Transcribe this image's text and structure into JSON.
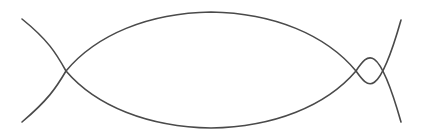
{
  "figure": {
    "title": "Two crossing arcs forming a vesica lens",
    "background_color": "#ffffff",
    "stroke_color": "#4a4a4a",
    "stroke_width": 1.6,
    "width": 423,
    "height": 139,
    "shape_name": "vesica-piscis-with-tails",
    "curves": [
      {
        "name": "upper-arc",
        "description": "Arc from lower-left tail, rising across the figure, peaking near the top center, descending to the upper-right tail",
        "start_point": [
          22,
          122
        ],
        "end_point": [
          401,
          20
        ],
        "apex_point": [
          211,
          12
        ],
        "path": "M 22 122 C 48 100 56 88 66 71 C 96 35 148 13 211 12 C 274 13 326 35 356 71 C 368 88 378 101 401 20"
      },
      {
        "name": "lower-arc",
        "description": "Arc from upper-left tail, descending across the figure, dipping near the bottom center, rising to the lower-right tail",
        "start_point": [
          22,
          19
        ],
        "end_point": [
          401,
          122
        ],
        "nadir_point": [
          211,
          128
        ],
        "path": "M 22 19 C 48 40 56 53 66 71 C 96 106 148 127 211 128 C 274 127 326 106 356 71 C 368 53 378 41 401 122"
      }
    ],
    "intersections": [
      {
        "name": "left-crossing",
        "x": 66,
        "y": 71
      },
      {
        "name": "right-crossing",
        "x": 358,
        "y": 71
      }
    ],
    "tails": [
      {
        "name": "upper-left-tip",
        "x": 22,
        "y": 19
      },
      {
        "name": "lower-left-tip",
        "x": 22,
        "y": 122
      },
      {
        "name": "upper-right-tip",
        "x": 401,
        "y": 20
      },
      {
        "name": "lower-right-tip",
        "x": 401,
        "y": 122
      }
    ]
  }
}
